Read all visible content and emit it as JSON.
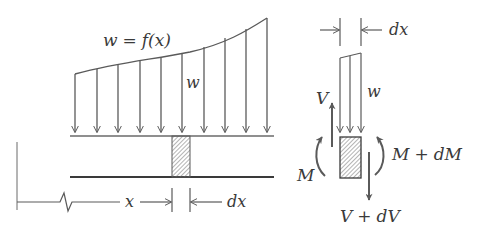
{
  "figure": {
    "type": "beam-distributed-load-free-body-diagram",
    "colors": {
      "line": "#5a5a5a",
      "text": "#3a3a3a",
      "hatch": "#6a6a6a",
      "background": "#ffffff"
    }
  },
  "beam_view": {
    "load_label": "w = f(x)",
    "load_label_parts": {
      "lhs": "w",
      "eq": "=",
      "rhs": "f(x)"
    },
    "intensity_label": "w",
    "position_label": "x",
    "element_width_label": "dx",
    "load_arrow_count": 10
  },
  "element_fbd": {
    "width_label": "dx",
    "load_label": "w",
    "shear_left": "V",
    "moment_left": "M",
    "moment_right": "M + dM",
    "moment_right_parts": {
      "a": "M",
      "op": "+",
      "b": "dM"
    },
    "shear_right": "V + dV",
    "shear_right_parts": {
      "a": "V",
      "op": "+",
      "b": "dV"
    }
  }
}
